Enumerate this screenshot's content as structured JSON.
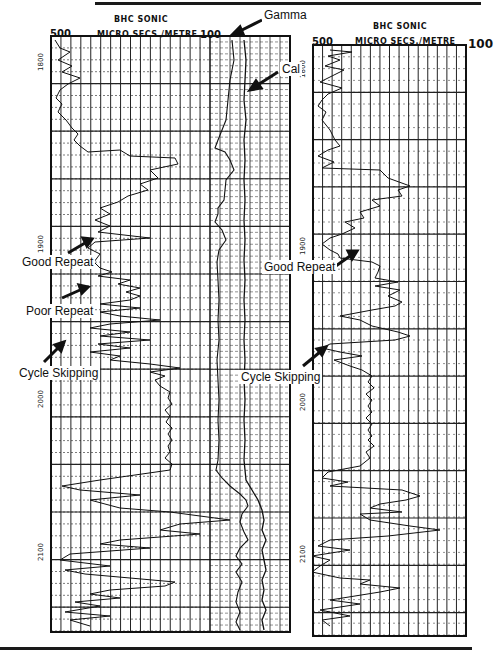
{
  "figure": {
    "left_log": {
      "title": "BHC  SONIC",
      "units": "MICRO SECS./METRE",
      "scale_left": "500",
      "scale_right": "100",
      "depth_labels": [
        {
          "text": "1800",
          "y": 58
        },
        {
          "text": "1900",
          "y": 240
        },
        {
          "text": "2000",
          "y": 395
        },
        {
          "text": "2100",
          "y": 548
        }
      ]
    },
    "right_log": {
      "title": "BHC  SONIC",
      "units": "MICRO SECS./METRE",
      "scale_left": "500",
      "scale_right": "100",
      "depth_labels": [
        {
          "text": "1800",
          "y": 65
        },
        {
          "text": "1900",
          "y": 242
        },
        {
          "text": "2000",
          "y": 398
        },
        {
          "text": "2100",
          "y": 550
        }
      ]
    },
    "annotations": {
      "gamma": "Gamma",
      "cal": "Cal",
      "left_good_repeat": "Good Repeat",
      "left_poor_repeat": "Poor Repeat",
      "left_cycle_skipping": "Cycle Skipping",
      "right_good_repeat": "Good Repeat",
      "right_cycle_skipping": "Cycle Skipping"
    }
  },
  "chart_data": {
    "type": "line",
    "panels": [
      {
        "name": "left log (sonic + gamma + caliper)",
        "xlabel": "MICRO SECS./METRE",
        "x_range": [
          500,
          100
        ],
        "y_label": "Depth (m)",
        "y_ticks": [
          1800,
          1900,
          2000,
          2100
        ],
        "y_range": [
          1790,
          2150
        ],
        "grid": true,
        "series": [
          "BHC Sonic",
          "Gamma",
          "Cal"
        ],
        "sonic_points": "55,40 60,48 70,52 58,60 72,66 62,72 80,78 68,84 60,90 56,98 62,104 58,112 66,120 72,128 78,134 74,140 80,146 88,152 120,150 130,156 175,158 178,164 150,170 158,178 140,184 148,190 128,196 118,202 100,208 110,214 95,220 110,226 98,232 150,238 95,242 88,248 100,254 94,262 100,268 112,272 98,276 130,280 118,284 140,288 126,292 140,296 130,300 100,304 140,308 100,312 120,316 160,320 110,324 90,328 130,332 100,336 150,340 98,344 130,348 90,352 120,356 110,360 150,364 180,368 150,372 165,376 155,380 160,386 170,392 168,398 172,404 165,410 170,416 166,422 172,428 168,434 172,440 168,446 170,452 165,458 172,464 170,470 100,480 62,486 80,490 140,495 90,500 120,508 170,512 200,516 230,520 180,524 160,530 200,534 120,540 100,544 150,548 70,554 60,560 110,566 65,570 85,574 130,578 175,582 165,586 110,590 90,594 120,598 75,602 100,606 65,612 110,616 70,620 90,626",
        "gamma_points": "232,40 234,60 230,80 228,100 226,120 222,130 218,140 215,148 225,152 230,160 234,170 226,180 224,200 218,208 218,214 215,222 222,230 226,240 219,250 217,262 218,280 219,300 218,320 219,340 217,360 218,380 219,400 218,420 219,440 218,460 216,470 222,478 230,486 240,494 246,500 248,506 242,514 240,522 244,532 248,540 240,548 236,556 242,564 236,572 242,582 238,592 236,602 240,612 236,622 240,630",
        "cal_points": "244,40 246,60 245,80 244,100 246,120 244,140 245,160 244,180 245,200 244,220 245,240 244,260 245,280 244,300 245,320 244,340 245,360 244,380 245,400 244,420 245,440 244,460 246,480 252,490 258,500 262,510 264,520 262,530 266,540 262,550 264,560 266,570 262,580 264,590 262,600 266,610 262,620 264,630"
      },
      {
        "name": "right log (sonic)",
        "xlabel": "MICRO SECS./METRE",
        "x_range": [
          500,
          100
        ],
        "y_label": "Depth (m)",
        "y_ticks": [
          1800,
          1900,
          2000,
          2100
        ],
        "y_range": [
          1790,
          2150
        ],
        "grid": true,
        "series": [
          "BHC Sonic"
        ],
        "sonic_points": "330,50 352,52 328,56 340,60 325,66 344,70 332,76 320,82 342,88 328,94 322,100 318,106 326,112 322,120 330,130 335,140 340,146 328,150 318,156 334,162 322,168 380,170 388,178 410,186 398,190 402,196 372,200 380,206 360,212 364,218 345,222 355,228 342,234 330,238 322,244 330,250 338,254 340,258 372,262 380,266 378,272 375,278 398,282 375,286 400,290 388,296 402,302 395,306 372,310 340,316 360,320 372,326 398,332 410,336 395,340 330,344 322,348 340,352 362,356 334,360 350,366 362,370 372,376 368,382 374,388 366,394 372,400 368,406 372,412 366,418 372,424 368,430 372,436 368,440 374,446 366,452 370,458 360,466 328,472 322,478 348,482 330,486 402,490 420,496 406,500 380,504 370,508 402,512 360,514 370,520 410,526 440,530 388,536 330,540 318,546 350,550 312,556 330,560 320,566 312,572 340,578 370,580 360,584 400,588 380,592 330,600 360,604 320,610 350,616 322,620 330,626"
      }
    ],
    "annotations": [
      {
        "text": "Gamma",
        "target": "gamma curve, left log middle track"
      },
      {
        "text": "Cal",
        "target": "caliper curve, left log middle track"
      },
      {
        "text": "Good Repeat",
        "panel": "left",
        "depth_approx": 1915
      },
      {
        "text": "Poor Repeat",
        "panel": "left",
        "depth_approx": 1945
      },
      {
        "text": "Cycle Skipping",
        "panel": "left",
        "depth_approx": 1975
      },
      {
        "text": "Good Repeat",
        "panel": "right",
        "depth_approx": 1915
      },
      {
        "text": "Cycle Skipping",
        "panel": "right",
        "depth_approx": 1970
      }
    ]
  }
}
